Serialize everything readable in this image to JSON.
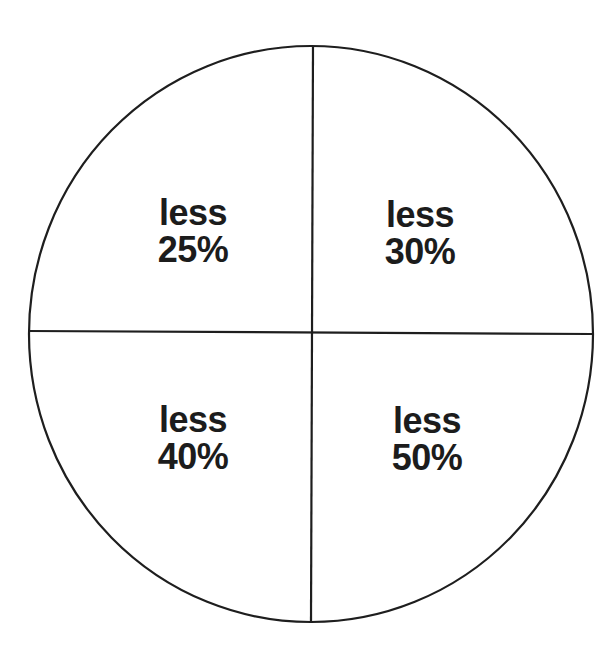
{
  "diagram": {
    "type": "circle divided into four quadrants",
    "colors": {
      "stroke": "#1e1e1e",
      "text": "#1c1c1c",
      "background": "#ffffff"
    },
    "quadrants": [
      {
        "position": "top-left",
        "line1": "less",
        "line2": "25%"
      },
      {
        "position": "top-right",
        "line1": "less",
        "line2": "30%"
      },
      {
        "position": "bottom-left",
        "line1": "less",
        "line2": "40%"
      },
      {
        "position": "bottom-right",
        "line1": "less",
        "line2": "50%"
      }
    ]
  }
}
